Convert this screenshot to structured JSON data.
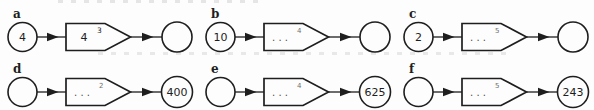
{
  "page": {
    "background": "#fdfdfd",
    "ink_color": "#1e1e1e",
    "muted_color": "#6f6f6f",
    "description_labels": [
      "a",
      "b",
      "c",
      "d",
      "e",
      "f"
    ]
  },
  "diagrams": [
    {
      "label": "a",
      "input": "4",
      "box_base": "4",
      "box_exponent": "3",
      "output": ""
    },
    {
      "label": "b",
      "input": "10",
      "box_base": ". . .",
      "box_exponent": "4",
      "output": ""
    },
    {
      "label": "c",
      "input": "2",
      "box_base": ". . .",
      "box_exponent": "5",
      "output": ""
    },
    {
      "label": "d",
      "input": "",
      "box_base": ". . .",
      "box_exponent": "2",
      "output": "400"
    },
    {
      "label": "e",
      "input": "",
      "box_base": ". . .",
      "box_exponent": "4",
      "output": "625"
    },
    {
      "label": "f",
      "input": "",
      "box_base": ". . .",
      "box_exponent": "5",
      "output": "243"
    }
  ]
}
